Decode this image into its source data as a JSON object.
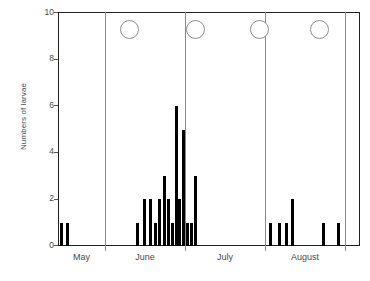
{
  "chart_data": {
    "type": "bar",
    "title": "",
    "xlabel": "",
    "ylabel": "Numbers of larvae",
    "ylim": [
      0,
      10
    ],
    "yticks": [
      0,
      2,
      4,
      6,
      8,
      10
    ],
    "grid": false,
    "legend": null,
    "x_axis_type": "date",
    "categories": [
      "May",
      "June",
      "July",
      "August"
    ],
    "panel_boundaries_label": [
      "May",
      "June",
      "July",
      "August"
    ],
    "annotations": [
      {
        "name": "full-moon",
        "panel": "May",
        "symbol": "open-circle",
        "y": 9.3
      },
      {
        "name": "full-moon",
        "panel": "June",
        "symbol": "open-circle",
        "y": 9.3
      },
      {
        "name": "full-moon",
        "panel": "July",
        "symbol": "open-circle",
        "y": 9.3
      },
      {
        "name": "full-moon",
        "panel": "August",
        "symbol": "open-circle",
        "y": 9.3
      }
    ],
    "series": [
      {
        "name": "Numbers of larvae",
        "color": "#000000",
        "bars": [
          {
            "x": 0.6,
            "value": 1,
            "month": "May"
          },
          {
            "x": 2.1,
            "value": 1,
            "month": "May"
          },
          {
            "x": 20.6,
            "value": 1,
            "month": "June"
          },
          {
            "x": 22.6,
            "value": 2,
            "month": "June"
          },
          {
            "x": 24.2,
            "value": 2,
            "month": "June"
          },
          {
            "x": 25.5,
            "value": 1,
            "month": "June"
          },
          {
            "x": 26.6,
            "value": 2,
            "month": "June"
          },
          {
            "x": 27.8,
            "value": 3,
            "month": "June"
          },
          {
            "x": 28.9,
            "value": 2,
            "month": "June"
          },
          {
            "x": 29.9,
            "value": 1,
            "month": "June"
          },
          {
            "x": 30.9,
            "value": 6,
            "month": "June"
          },
          {
            "x": 31.9,
            "value": 2,
            "month": "June"
          },
          {
            "x": 32.9,
            "value": 5,
            "month": "June"
          },
          {
            "x": 33.9,
            "value": 1,
            "month": "June"
          },
          {
            "x": 34.9,
            "value": 1,
            "month": "June"
          },
          {
            "x": 35.9,
            "value": 3,
            "month": "June"
          },
          {
            "x": 56.0,
            "value": 1,
            "month": "July"
          },
          {
            "x": 58.4,
            "value": 1,
            "month": "July"
          },
          {
            "x": 60.1,
            "value": 1,
            "month": "July"
          },
          {
            "x": 61.8,
            "value": 2,
            "month": "July"
          },
          {
            "x": 70.0,
            "value": 1,
            "month": "August"
          },
          {
            "x": 74.0,
            "value": 1,
            "month": "August"
          }
        ]
      }
    ],
    "axis": {
      "y_min_label": "0",
      "y_max_label": "10"
    }
  },
  "yticks": {
    "t0": "0",
    "t2": "2",
    "t4": "4",
    "t6": "6",
    "t8": "8",
    "t10": "10"
  },
  "months": {
    "m1": "May",
    "m2": "June",
    "m3": "July",
    "m4": "August"
  },
  "labels": {
    "ylabel": "Numbers of larvae"
  }
}
